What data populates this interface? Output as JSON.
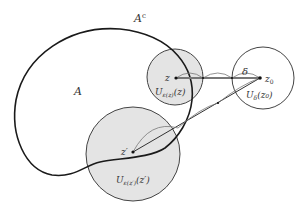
{
  "diagram": {
    "labels": {
      "complement": "A",
      "complement_sup": "c",
      "set": "A",
      "z": "z",
      "z0": "z",
      "z0_sub": "0",
      "z_prime": "z′",
      "delta": "δ",
      "u_eps_z": "U",
      "u_eps_z_sub": "ε(z)",
      "u_eps_z_arg": "(z)",
      "u_delta": "U",
      "u_delta_sub": "δ",
      "u_delta_arg": "(z₀)",
      "u_eps_zp": "U",
      "u_eps_zp_sub": "ε(z′)",
      "u_eps_zp_arg": "(z′)"
    },
    "colors": {
      "shade": "#e4e4e4",
      "stroke": "#222222",
      "thin": "#555555"
    }
  }
}
